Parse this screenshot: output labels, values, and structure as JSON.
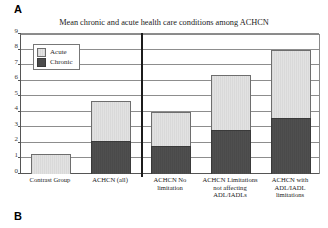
{
  "panels": {
    "top_label": "A",
    "bottom_label": "B"
  },
  "chart_data": {
    "type": "bar",
    "subtype": "stacked",
    "title": "Mean chronic and acute health care conditions among ACHCN",
    "xlabel": "",
    "ylabel": "",
    "ylim": [
      0,
      9
    ],
    "ytick_labels": [
      "0",
      "1",
      "2",
      "3",
      "4",
      "5",
      "6",
      "7",
      "8",
      "9"
    ],
    "yticks": [
      0,
      1,
      2,
      3,
      4,
      5,
      6,
      7,
      8,
      9
    ],
    "grid": "horizontal",
    "legend_position": "upper-left-inside",
    "categories": [
      "Contrast Group",
      "ACHCN (all)",
      "ACHCN No limitation",
      "ACHCN Limitations not affecting ADL/IADLs",
      "ACHCN with ADL/IADL limitations"
    ],
    "series": [
      {
        "name": "Chronic",
        "color": "#4c4c4c",
        "values": [
          0,
          2.1,
          1.8,
          2.85,
          3.6
        ]
      },
      {
        "name": "Acute",
        "color": "#dedede",
        "values": [
          1.3,
          2.6,
          2.2,
          3.5,
          4.4
        ]
      }
    ],
    "totals": [
      1.3,
      4.7,
      4.0,
      6.35,
      8.0
    ],
    "annotations": {
      "divider_after_category_index": 1,
      "divider_note": "vertical rule separating Contrast Group / ACHCN (all) from ACHCN subgroups"
    }
  },
  "legend": {
    "items": [
      {
        "label": "Acute",
        "swatch": "light-gray-hatch"
      },
      {
        "label": "Chronic",
        "swatch": "dark-gray"
      }
    ]
  }
}
